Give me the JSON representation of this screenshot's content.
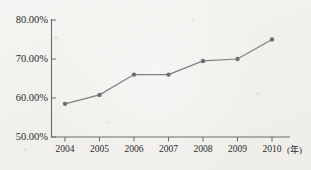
{
  "chart_data": {
    "type": "line",
    "title": "",
    "xlabel": "年",
    "ylabel": "",
    "categories": [
      "2004",
      "2005",
      "2006",
      "2007",
      "2008",
      "2009",
      "2010"
    ],
    "values": [
      58.5,
      60.8,
      66.0,
      66.0,
      69.5,
      70.0,
      75.0
    ],
    "series": [
      {
        "name": "",
        "values": [
          58.5,
          60.8,
          66.0,
          66.0,
          69.5,
          70.0,
          75.0
        ]
      }
    ],
    "ylim": [
      50,
      80
    ],
    "xlim": [
      "2004",
      "2010"
    ],
    "y_tick_labels": [
      "80.00%",
      "70.00%",
      "60.00%",
      "50.00%"
    ],
    "y_tick_values": [
      80,
      70,
      60,
      50
    ],
    "x_tick_labels": [
      "2004",
      "2005",
      "2006",
      "2007",
      "2008",
      "2009",
      "2010"
    ],
    "x_axis_unit": "(年)",
    "grid": false,
    "legend": "none",
    "line_color": "#7e7e7e",
    "marker_color": "#6f6f6f",
    "marker_shape": "circle",
    "axis_color": "#6a6a6a",
    "text_color": "#2a2a2a"
  }
}
